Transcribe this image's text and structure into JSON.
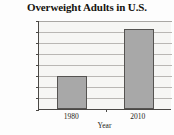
{
  "chart_data": {
    "type": "bar",
    "title": "Overweight Adults in U.S.",
    "xlabel": "Year",
    "ylabel": "Percent",
    "categories": [
      "1980",
      "2010"
    ],
    "values": [
      15,
      36
    ],
    "value_unit": "%",
    "ylim": [
      0,
      40
    ],
    "ytick_step": 5,
    "ytick_labels": [
      "0%",
      "5%",
      "10%",
      "15%",
      "20%",
      "25%",
      "30%",
      "35%",
      "40%"
    ],
    "ytick_values": [
      0,
      5,
      10,
      15,
      20,
      25,
      30,
      35,
      40
    ],
    "grid": true,
    "grid_orientation": "horizontal",
    "legend": false,
    "legend_position": "none",
    "series": [
      {
        "name": "Overweight adults",
        "values": [
          15,
          36
        ]
      }
    ],
    "colors": {
      "bar_fill": "#a8a8a8",
      "bar_border": "#555351",
      "grid": "#b9b7b4",
      "axis": "#4a4845",
      "plot_background": "#f6f6f4",
      "text": "#1d1b18",
      "page_background": "#fdfdfd"
    }
  }
}
